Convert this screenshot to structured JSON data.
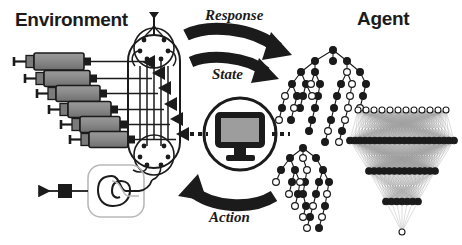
{
  "figure": {
    "kind": "closed-loop-control-diagram",
    "background_color": "#ffffff",
    "ink_color": "#1b1b1b",
    "fill_gray": "#8c8c8c",
    "titles": {
      "environment": "Environment",
      "agent": "Agent"
    },
    "flow_labels": {
      "response": "Response",
      "state": "State",
      "action": "Action"
    },
    "environment": {
      "syringe_count": 6,
      "syringes": [
        {
          "x": 14,
          "y": 58,
          "length": 56
        },
        {
          "x": 24,
          "y": 76,
          "length": 52
        },
        {
          "x": 34,
          "y": 92,
          "length": 50
        },
        {
          "x": 44,
          "y": 108,
          "length": 50
        },
        {
          "x": 54,
          "y": 124,
          "length": 48
        },
        {
          "x": 64,
          "y": 139,
          "length": 48
        }
      ],
      "manifold": {
        "label": "rotary-valve-manifold",
        "ports_per_valve": 6,
        "valves": 2
      },
      "reactor_chip": {
        "label": "serpentine-reactor-chip",
        "outlet_direction": "left"
      }
    },
    "controller": {
      "icon": "computer-monitor-icon",
      "shape": "circle"
    },
    "agent": {
      "decision_tree": {
        "label": "decision-tree",
        "node_styles": [
          "filled",
          "hollow"
        ]
      },
      "neural_network": {
        "label": "neural-network",
        "layers": [
          12,
          22,
          14,
          7,
          1
        ],
        "node_styles": [
          "hollow",
          "filled",
          "filled",
          "filled",
          "hollow"
        ]
      }
    }
  }
}
